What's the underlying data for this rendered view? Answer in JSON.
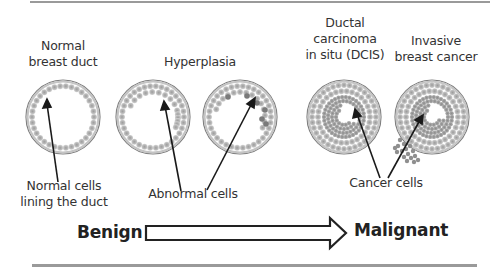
{
  "diagram": {
    "title_labels": [
      {
        "id": "normal",
        "lines": [
          "Normal",
          "breast duct"
        ]
      },
      {
        "id": "hyperplasia",
        "lines": [
          "Hyperplasia"
        ]
      },
      {
        "id": "dcis",
        "lines": [
          "Ductal",
          "carcinoma",
          "in situ (DCIS)"
        ]
      },
      {
        "id": "invasive",
        "lines": [
          "Invasive",
          "breast cancer"
        ]
      }
    ],
    "callouts": [
      {
        "id": "normal-cells",
        "lines": [
          "Normal cells",
          "lining the duct"
        ]
      },
      {
        "id": "abnormal-cells",
        "lines": [
          "Abnormal cells"
        ]
      },
      {
        "id": "cancer-cells",
        "lines": [
          "Cancer cells"
        ]
      }
    ],
    "progression": {
      "start_label": "Benign",
      "end_label": "Malignant"
    },
    "colors": {
      "duct_wall": "#8c8c8c",
      "cell": "#a9a9a9",
      "cell_dark": "#7a7a7a",
      "cancer_cell": "#8f8f8f",
      "pointer": "#1a1a1a",
      "rule": "#9a9a9a"
    }
  }
}
